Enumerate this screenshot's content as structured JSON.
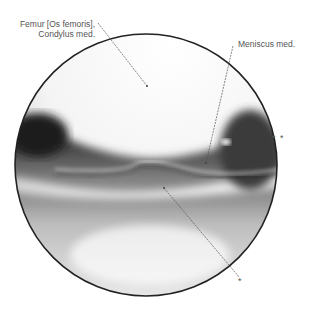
{
  "figure": {
    "labels": {
      "femur_line1": "Femur [Os femoris],",
      "femur_line2": "Condylus med.",
      "meniscus": "Meniscus med.",
      "marker_double": "* *",
      "marker_single": "*"
    },
    "colors": {
      "outline": "#222222",
      "leader": "#555555",
      "label_text": "#555555"
    }
  }
}
